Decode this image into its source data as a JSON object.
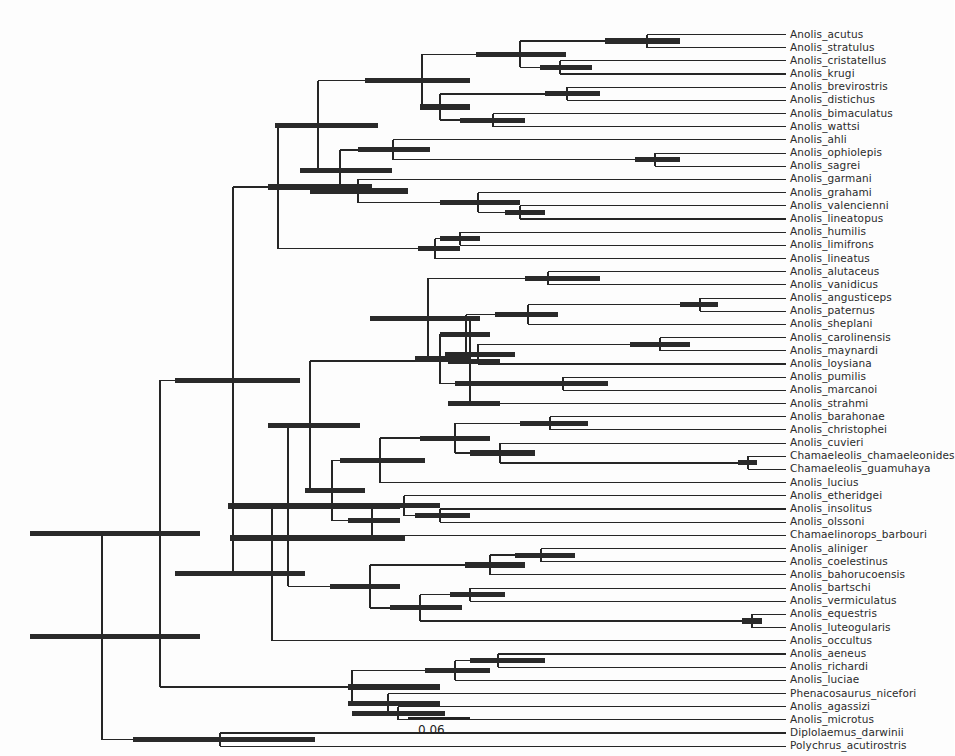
{
  "figure": {
    "type": "phylogenetic-tree",
    "style": "rectangular-cladogram-with-hpd-bars",
    "background_color": "#fdfdfd",
    "branch_color": "#262626",
    "hpd_bar_color": "#2a2a2a",
    "label_color": "#2b2b2b",
    "width": 954,
    "height": 756
  },
  "scalebar": {
    "label": "0.06",
    "x_start": 408,
    "x_end": 470,
    "y": 718,
    "label_x": 418,
    "label_y": 723
  },
  "layout": {
    "row_height": 13.18,
    "first_row_y": 34.5,
    "tip_line_end_x": 786,
    "label_x": 790,
    "root_x": 102,
    "root_y": 625
  },
  "taxa": [
    {
      "name": "Anolis_acutus",
      "row": 0,
      "branch_x": 647
    },
    {
      "name": "Anolis_stratulus",
      "row": 1,
      "branch_x": 625
    },
    {
      "name": "Anolis_cristatellus",
      "row": 2,
      "branch_x": 560
    },
    {
      "name": "Anolis_krugi",
      "row": 3,
      "branch_x": 560
    },
    {
      "name": "Anolis_brevirostris",
      "row": 4,
      "branch_x": 567
    },
    {
      "name": "Anolis_distichus",
      "row": 5,
      "branch_x": 567
    },
    {
      "name": "Anolis_bimaculatus",
      "row": 6,
      "branch_x": 493
    },
    {
      "name": "Anolis_wattsi",
      "row": 7,
      "branch_x": 493
    },
    {
      "name": "Anolis_ahli",
      "row": 8,
      "branch_x": 393
    },
    {
      "name": "Anolis_ophiolepis",
      "row": 9,
      "branch_x": 655
    },
    {
      "name": "Anolis_sagrei",
      "row": 10,
      "branch_x": 655
    },
    {
      "name": "Anolis_garmani",
      "row": 11,
      "branch_x": 358
    },
    {
      "name": "Anolis_grahami",
      "row": 12,
      "branch_x": 636
    },
    {
      "name": "Anolis_valencienni",
      "row": 13,
      "branch_x": 520
    },
    {
      "name": "Anolis_lineatopus",
      "row": 14,
      "branch_x": 520
    },
    {
      "name": "Anolis_humilis",
      "row": 15,
      "branch_x": 476
    },
    {
      "name": "Anolis_limifrons",
      "row": 16,
      "branch_x": 460
    },
    {
      "name": "Anolis_lineatus",
      "row": 17,
      "branch_x": 435
    },
    {
      "name": "Anolis_alutaceus",
      "row": 18,
      "branch_x": 548
    },
    {
      "name": "Anolis_vanidicus",
      "row": 19,
      "branch_x": 548
    },
    {
      "name": "Anolis_angusticeps",
      "row": 20,
      "branch_x": 700
    },
    {
      "name": "Anolis_paternus",
      "row": 21,
      "branch_x": 700
    },
    {
      "name": "Anolis_sheplani",
      "row": 22,
      "branch_x": 528
    },
    {
      "name": "Anolis_carolinensis",
      "row": 23,
      "branch_x": 466
    },
    {
      "name": "Anolis_maynardi",
      "row": 24,
      "branch_x": 660
    },
    {
      "name": "Anolis_loysiana",
      "row": 25,
      "branch_x": 478
    },
    {
      "name": "Anolis_pumilis",
      "row": 26,
      "branch_x": 563
    },
    {
      "name": "Anolis_marcanoi",
      "row": 27,
      "branch_x": 563
    },
    {
      "name": "Anolis_strahmi",
      "row": 28,
      "branch_x": 470
    },
    {
      "name": "Anolis_barahonae",
      "row": 29,
      "branch_x": 550
    },
    {
      "name": "Anolis_christophei",
      "row": 30,
      "branch_x": 550
    },
    {
      "name": "Anolis_cuvieri",
      "row": 31,
      "branch_x": 500
    },
    {
      "name": "Chamaeleolis_chamaeleonides",
      "row": 32,
      "branch_x": 748
    },
    {
      "name": "Chamaeleolis_guamuhaya",
      "row": 33,
      "branch_x": 748
    },
    {
      "name": "Anolis_lucius",
      "row": 34,
      "branch_x": 380
    },
    {
      "name": "Anolis_etheridgei",
      "row": 35,
      "branch_x": 538
    },
    {
      "name": "Anolis_insolitus",
      "row": 36,
      "branch_x": 440
    },
    {
      "name": "Anolis_olssoni",
      "row": 37,
      "branch_x": 440
    },
    {
      "name": "Chamaelinorops_barbouri",
      "row": 38,
      "branch_x": 372
    },
    {
      "name": "Anolis_aliniger",
      "row": 39,
      "branch_x": 541
    },
    {
      "name": "Anolis_coelestinus",
      "row": 40,
      "branch_x": 541
    },
    {
      "name": "Anolis_bahorucoensis",
      "row": 41,
      "branch_x": 490
    },
    {
      "name": "Anolis_bartschi",
      "row": 42,
      "branch_x": 470
    },
    {
      "name": "Anolis_vermiculatus",
      "row": 43,
      "branch_x": 470
    },
    {
      "name": "Anolis_equestris",
      "row": 44,
      "branch_x": 752
    },
    {
      "name": "Anolis_luteogularis",
      "row": 45,
      "branch_x": 752
    },
    {
      "name": "Anolis_occultus",
      "row": 46,
      "branch_x": 272
    },
    {
      "name": "Anolis_aeneus",
      "row": 47,
      "branch_x": 645
    },
    {
      "name": "Anolis_richardi",
      "row": 48,
      "branch_x": 498
    },
    {
      "name": "Anolis_luciae",
      "row": 49,
      "branch_x": 498
    },
    {
      "name": "Phenacosaurus_nicefori",
      "row": 50,
      "branch_x": 455
    },
    {
      "name": "Anolis_agassizi",
      "row": 51,
      "branch_x": 398
    },
    {
      "name": "Anolis_microtus",
      "row": 52,
      "branch_x": 398
    },
    {
      "name": "Diplolaemus_darwinii",
      "row": 53,
      "branch_x": 220
    },
    {
      "name": "Polychrus_acutirostris",
      "row": 54,
      "branch_x": 132
    }
  ],
  "nodes": [
    {
      "id": "n_acu_str",
      "x": 647,
      "y_top": 34.5,
      "y_bot": 47.7,
      "bar": [
        605,
        680
      ]
    },
    {
      "id": "n_cri_kru",
      "x": 560,
      "y_top": 60.9,
      "y_bot": 74.1,
      "bar": [
        540,
        592
      ]
    },
    {
      "id": "n_acu_cri",
      "x": 520,
      "y_top": 41.1,
      "y_bot": 67.5,
      "bar": [
        476,
        566
      ]
    },
    {
      "id": "n_bre_dis",
      "x": 567,
      "y_top": 87.3,
      "y_bot": 100.5,
      "bar": [
        545,
        600
      ]
    },
    {
      "id": "n_bim_wat",
      "x": 493,
      "y_top": 113.7,
      "y_bot": 126.9,
      "bar": [
        460,
        525
      ]
    },
    {
      "id": "n_bre_bim",
      "x": 440,
      "y_top": 93.9,
      "y_bot": 120.3,
      "bar": [
        420,
        470
      ]
    },
    {
      "id": "n_acu_bre",
      "x": 422,
      "y_top": 54.3,
      "y_bot": 107.1,
      "bar": [
        365,
        470
      ]
    },
    {
      "id": "n_oph_sag",
      "x": 655,
      "y_top": 153.3,
      "y_bot": 166.5,
      "bar": [
        635,
        680
      ]
    },
    {
      "id": "n_ahl_sag",
      "x": 393,
      "y_top": 140.1,
      "y_bot": 159.9,
      "bar": [
        358,
        430
      ]
    },
    {
      "id": "n_val_lin",
      "x": 520,
      "y_top": 205.5,
      "y_bot": 218.7,
      "bar": [
        505,
        545
      ]
    },
    {
      "id": "n_gra_lin",
      "x": 478,
      "y_top": 192.3,
      "y_bot": 212.1,
      "bar": [
        440,
        520
      ]
    },
    {
      "id": "n_gar_gra",
      "x": 358,
      "y_top": 179.1,
      "y_bot": 202.2,
      "bar": [
        310,
        408
      ]
    },
    {
      "id": "n_crown1",
      "x": 318,
      "y_top": 80.7,
      "y_bot": 190.6,
      "bar": [
        275,
        378
      ]
    },
    {
      "id": "n_hum_lim",
      "x": 460,
      "y_top": 231.9,
      "y_bot": 245.1,
      "bar": [
        440,
        480
      ]
    },
    {
      "id": "n_hum_line",
      "x": 435,
      "y_top": 238.5,
      "y_bot": 258.3,
      "bar": [
        418,
        460
      ]
    },
    {
      "id": "n_mainland1",
      "x": 278,
      "y_top": 135.5,
      "y_bot": 248.4,
      "bar": [
        268,
        372
      ]
    },
    {
      "id": "n_alu_van",
      "x": 548,
      "y_top": 271.5,
      "y_bot": 284.7,
      "bar": [
        525,
        600
      ]
    },
    {
      "id": "n_ang_pat",
      "x": 700,
      "y_top": 297.9,
      "y_bot": 311.1,
      "bar": [
        680,
        718
      ]
    },
    {
      "id": "n_ang_she",
      "x": 528,
      "y_top": 304.5,
      "y_bot": 324.3,
      "bar": [
        495,
        558
      ]
    },
    {
      "id": "n_car_may",
      "x": 660,
      "y_top": 350.7,
      "y_bot": 337.5,
      "bar": [
        630,
        690
      ]
    },
    {
      "id": "n_car_loy",
      "x": 478,
      "y_top": 331.0,
      "y_bot": 363.9,
      "bar": [
        445,
        515
      ]
    },
    {
      "id": "n_ang_car",
      "x": 466,
      "y_top": 314.4,
      "y_bot": 344.5,
      "bar": [
        440,
        490
      ]
    },
    {
      "id": "n_pum_mar",
      "x": 563,
      "y_top": 377.1,
      "y_bot": 390.3,
      "bar": [
        520,
        608
      ]
    },
    {
      "id": "n_pum_sub",
      "x": 490,
      "y_top": 383.7,
      "y_bot": 383.7,
      "bar": [
        455,
        525
      ]
    },
    {
      "id": "n_clade_alu",
      "x": 428,
      "y_top": 278.1,
      "y_bot": 383.7,
      "bar": [
        370,
        480
      ]
    },
    {
      "id": "n_str_mar",
      "x": 470,
      "y_top": 403.5,
      "y_bot": 403.5,
      "bar": [
        448,
        500
      ]
    },
    {
      "id": "n_bar_chr",
      "x": 550,
      "y_top": 416.7,
      "y_bot": 429.9,
      "bar": [
        520,
        588
      ]
    },
    {
      "id": "n_cha_cha",
      "x": 748,
      "y_top": 456.3,
      "y_bot": 469.5,
      "bar": [
        738,
        757
      ]
    },
    {
      "id": "n_cuv_cha",
      "x": 500,
      "y_top": 443.1,
      "y_bot": 462.9,
      "bar": [
        470,
        535
      ]
    },
    {
      "id": "n_bar_cuv",
      "x": 455,
      "y_top": 423.3,
      "y_bot": 453.0,
      "bar": [
        420,
        490
      ]
    },
    {
      "id": "n_bar_luc",
      "x": 380,
      "y_top": 438.1,
      "y_bot": 482.7,
      "bar": [
        340,
        425
      ]
    },
    {
      "id": "n_ins_ols",
      "x": 440,
      "y_top": 508.0,
      "y_bot": 521.2,
      "bar": [
        415,
        470
      ]
    },
    {
      "id": "n_eth_ols",
      "x": 404,
      "y_top": 494.8,
      "y_bot": 514.6,
      "bar": [
        370,
        440
      ]
    },
    {
      "id": "n_cham_bar",
      "x": 372,
      "y_top": 504.7,
      "y_bot": 534.4,
      "bar": [
        348,
        400
      ]
    },
    {
      "id": "n_big_west",
      "x": 332,
      "y_top": 460.4,
      "y_bot": 519.5,
      "bar": [
        305,
        365
      ]
    },
    {
      "id": "n_ali_coe",
      "x": 541,
      "y_top": 548.0,
      "y_bot": 561.2,
      "bar": [
        515,
        575
      ]
    },
    {
      "id": "n_ali_bah",
      "x": 490,
      "y_top": 554.6,
      "y_bot": 574.4,
      "bar": [
        465,
        525
      ]
    },
    {
      "id": "n_bar_ver",
      "x": 470,
      "y_top": 587.6,
      "y_bot": 600.8,
      "bar": [
        450,
        505
      ]
    },
    {
      "id": "n_equ_lut",
      "x": 752,
      "y_top": 614.0,
      "y_bot": 627.2,
      "bar": [
        742,
        762
      ]
    },
    {
      "id": "n_bar_equ",
      "x": 420,
      "y_top": 594.2,
      "y_bot": 620.6,
      "bar": [
        390,
        462
      ]
    },
    {
      "id": "n_ali_equ",
      "x": 370,
      "y_top": 564.5,
      "y_bot": 607.4,
      "bar": [
        330,
        400
      ]
    },
    {
      "id": "n_big_ali",
      "x": 308,
      "y_top": 490.0,
      "y_bot": 586.0,
      "bar": [
        230,
        405
      ]
    },
    {
      "id": "n_occ_join",
      "x": 272,
      "y_top": 538.0,
      "y_bot": 640.1,
      "bar": [
        175,
        305
      ]
    },
    {
      "id": "n_aen_ric",
      "x": 498,
      "y_top": 653.3,
      "y_bot": 666.5,
      "bar": [
        470,
        545
      ]
    },
    {
      "id": "n_aen_luc",
      "x": 455,
      "y_top": 646.7,
      "y_bot": 659.9,
      "bar": [
        425,
        490
      ]
    },
    {
      "id": "n_aga_mic",
      "x": 398,
      "y_top": 686.3,
      "y_bot": 699.5,
      "bar": [
        352,
        445
      ]
    },
    {
      "id": "n_phe_mic",
      "x": 388,
      "y_top": 653.3,
      "y_bot": 692.9,
      "bar": [
        348,
        440
      ]
    },
    {
      "id": "n_mainland2",
      "x": 233,
      "y_top": 621.0,
      "y_bot": 673.1,
      "bar": [
        175,
        300
      ]
    },
    {
      "id": "n_root",
      "x": 102,
      "y_top": 625.0,
      "y_bot": 706.0,
      "bar": [
        30,
        200
      ]
    },
    {
      "id": "n_outgroup",
      "x": 220,
      "y_top": 699.0,
      "y_bot": 712.2,
      "bar": [
        133,
        315
      ]
    }
  ]
}
